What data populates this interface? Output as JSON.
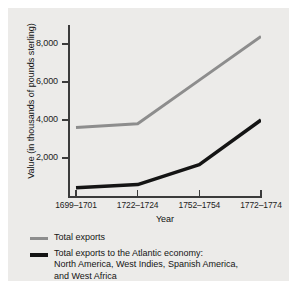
{
  "chart_data": {
    "type": "line",
    "title": "",
    "subtitle": "",
    "xlabel": "Year",
    "ylabel": "Value (in thousands of pounds sterling)",
    "categories": [
      "1699–1701",
      "1722–1724",
      "1752–1754",
      "1772–1774"
    ],
    "ylim": [
      0,
      9000
    ],
    "yticks": [
      2000,
      4000,
      6000,
      8000
    ],
    "ytick_labels": [
      "2,000",
      "4,000",
      "6,000",
      "8,000"
    ],
    "grid": false,
    "legend_position": "below",
    "series": [
      {
        "name": "Total exports",
        "color": "#8d8d8d",
        "values": [
          3600,
          3800,
          6100,
          8400
        ]
      },
      {
        "name": "Total exports to the Atlantic economy: North America, West Indies, Spanish America, and West Africa",
        "color": "#141414",
        "values": [
          430,
          600,
          1650,
          4000
        ]
      }
    ]
  },
  "legend": {
    "items": [
      {
        "label_line1": "Total exports",
        "label_line2": "",
        "label_line3": ""
      },
      {
        "label_line1": "Total exports to the Atlantic economy:",
        "label_line2": "North America, West Indies, Spanish America,",
        "label_line3": "and West Africa"
      }
    ]
  },
  "colors": {
    "panel_background": "#ecebe9",
    "axis": "#3b3b3b",
    "series_total_exports": "#8d8d8d",
    "series_atlantic": "#141414",
    "text": "#141414"
  }
}
